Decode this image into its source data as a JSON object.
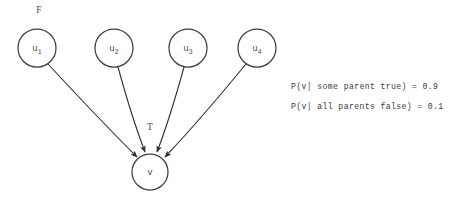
{
  "diagram": {
    "type": "bayesian-network-noisy-or",
    "background_color": "#ffffff",
    "stroke_color": "#3f3f3f",
    "text_color": "#3c3c3c",
    "parent_nodes": [
      {
        "id": "u1",
        "base": "u",
        "subscript": "1",
        "cx": 37,
        "cy": 48,
        "r": 19
      },
      {
        "id": "u2",
        "base": "u",
        "subscript": "2",
        "cx": 114,
        "cy": 48,
        "r": 19
      },
      {
        "id": "u3",
        "base": "u",
        "subscript": "3",
        "cx": 188,
        "cy": 48,
        "r": 19
      },
      {
        "id": "u4",
        "base": "u",
        "subscript": "4",
        "cx": 257,
        "cy": 48,
        "r": 19
      }
    ],
    "child_node": {
      "id": "v",
      "base": "v",
      "cx": 150,
      "cy": 172,
      "r": 18
    },
    "state_labels": [
      {
        "id": "f-label",
        "text": "F",
        "x": 39,
        "y": 11
      },
      {
        "id": "t-label",
        "text": "T",
        "x": 150,
        "y": 128
      }
    ],
    "edges": [
      {
        "from": "u1",
        "to": "v",
        "path": "M 48 64 Q 98 118 137 157"
      },
      {
        "from": "u2",
        "to": "v",
        "path": "M 118 67 Q 132 118 145 152"
      },
      {
        "from": "u3",
        "to": "v",
        "path": "M 184 67 Q 170 118 157 152"
      },
      {
        "from": "u4",
        "to": "v",
        "path": "M 246 64 Q 200 120 165 157"
      }
    ],
    "cpt": {
      "lines": [
        "P(v| some parent true) = 0.9",
        "P(v| all parents false) = 0.1"
      ],
      "probabilities": [
        {
          "condition": "some parent true",
          "value": "0.9"
        },
        {
          "condition": "all parents false",
          "value": "0.1"
        }
      ]
    }
  }
}
